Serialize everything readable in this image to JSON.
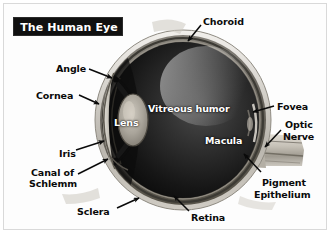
{
  "figure": {
    "title": "The Human Eye",
    "background_color": "#ffffff",
    "frame_color": "#d9d9d9",
    "title_background": "#101010",
    "title_color": "#ffffff"
  },
  "labels": [
    {
      "id": "choroid",
      "text": "Choroid",
      "color": "#0a0a0a",
      "x": 203,
      "y": 16,
      "anchor": "start"
    },
    {
      "id": "angle",
      "text": "Angle",
      "color": "#0a0a0a",
      "x": 56,
      "y": 63,
      "anchor": "start"
    },
    {
      "id": "cornea",
      "text": "Cornea",
      "color": "#0a0a0a",
      "x": 36,
      "y": 90,
      "anchor": "start"
    },
    {
      "id": "iris",
      "text": "Iris",
      "color": "#0a0a0a",
      "x": 59,
      "y": 148,
      "anchor": "start"
    },
    {
      "id": "canal1",
      "text": "Canal of",
      "color": "#0a0a0a",
      "x": 31,
      "y": 167,
      "anchor": "start"
    },
    {
      "id": "canal2",
      "text": "Schlemm",
      "color": "#0a0a0a",
      "x": 29,
      "y": 178,
      "anchor": "start"
    },
    {
      "id": "sclera",
      "text": "Sclera",
      "color": "#0a0a0a",
      "x": 77,
      "y": 206,
      "anchor": "start"
    },
    {
      "id": "retina",
      "text": "Retina",
      "color": "#0a0a0a",
      "x": 191,
      "y": 212,
      "anchor": "start"
    },
    {
      "id": "lens",
      "text": "Lens",
      "color": "#ffffff",
      "x": 114,
      "y": 117,
      "anchor": "start"
    },
    {
      "id": "vitreous",
      "text": "Vitreous humor",
      "color": "#ffffff",
      "x": 148,
      "y": 103,
      "anchor": "start"
    },
    {
      "id": "macula",
      "text": "Macula",
      "color": "#ffffff",
      "x": 205,
      "y": 135,
      "anchor": "start"
    },
    {
      "id": "fovea",
      "text": "Fovea",
      "color": "#0a0a0a",
      "x": 277,
      "y": 101,
      "anchor": "start"
    },
    {
      "id": "optic1",
      "text": "Optic",
      "color": "#0a0a0a",
      "x": 285,
      "y": 119,
      "anchor": "start"
    },
    {
      "id": "optic2",
      "text": "Nerve",
      "color": "#0a0a0a",
      "x": 283,
      "y": 131,
      "anchor": "start"
    },
    {
      "id": "pigment1",
      "text": "Pigment",
      "color": "#0a0a0a",
      "x": 262,
      "y": 177,
      "anchor": "start"
    },
    {
      "id": "pigment2",
      "text": "Epithelium",
      "color": "#0a0a0a",
      "x": 254,
      "y": 189,
      "anchor": "start"
    }
  ],
  "leader_lines": [
    {
      "id": "choroid-arrow",
      "from": [
        201,
        25
      ],
      "to": [
        188,
        41
      ]
    },
    {
      "id": "angle-arrow",
      "from": [
        89,
        69
      ],
      "to": [
        112,
        78
      ]
    },
    {
      "id": "cornea-arrow",
      "from": [
        79,
        95
      ],
      "to": [
        99,
        104
      ]
    },
    {
      "id": "iris-arrow",
      "from": [
        76,
        150
      ],
      "to": [
        104,
        141
      ]
    },
    {
      "id": "canal-arrow",
      "from": [
        78,
        174
      ],
      "to": [
        108,
        159
      ]
    },
    {
      "id": "sclera-arrow",
      "from": [
        117,
        208
      ],
      "to": [
        139,
        198
      ]
    },
    {
      "id": "retina-arrow",
      "from": [
        189,
        211
      ],
      "to": [
        174,
        196
      ]
    },
    {
      "id": "fovea-arrow",
      "from": [
        274,
        106
      ],
      "to": [
        253,
        112
      ]
    },
    {
      "id": "optic-arrow",
      "from": [
        281,
        130
      ],
      "to": [
        265,
        147
      ]
    },
    {
      "id": "pigment-arrow",
      "from": [
        261,
        172
      ],
      "to": [
        244,
        154
      ]
    }
  ],
  "anatomy_parts": [
    "sclera",
    "cornea",
    "iris",
    "lens",
    "vitreous humor",
    "choroid",
    "retina",
    "macula",
    "fovea",
    "optic nerve",
    "pigment epithelium",
    "canal of Schlemm",
    "angle"
  ]
}
